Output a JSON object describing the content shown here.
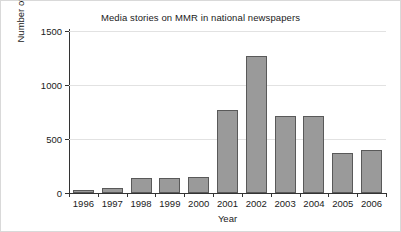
{
  "chart_data": {
    "type": "bar",
    "title": "Media stories on MMR in national newspapers",
    "xlabel": "Year",
    "ylabel": "Number of stories",
    "categories": [
      "1996",
      "1997",
      "1998",
      "1999",
      "2000",
      "2001",
      "2002",
      "2003",
      "2004",
      "2005",
      "2006"
    ],
    "values": [
      25,
      45,
      135,
      140,
      145,
      770,
      1270,
      715,
      710,
      370,
      400
    ],
    "yticks": [
      0,
      500,
      1000,
      1500
    ],
    "ytick_labels": [
      "0",
      "500",
      "1000",
      "1500"
    ],
    "ylim": [
      0,
      1500
    ],
    "grid": true,
    "legend": "none",
    "bar_color": "#9a9a9a",
    "bar_edge_color": "#595959",
    "gridline_color": "#e2e2e2",
    "axis_color": "#333333",
    "background": "#ffffff"
  }
}
